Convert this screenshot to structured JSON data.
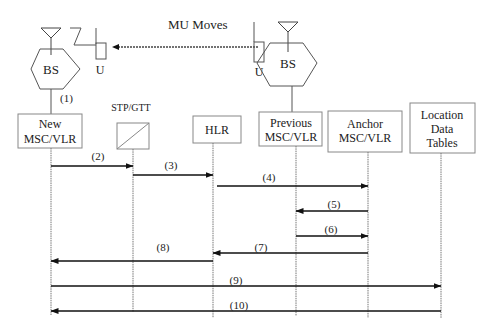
{
  "title_label": "MU Moves",
  "base_stations": [
    {
      "id": "bs-new",
      "label": "BS",
      "unit_label": "U"
    },
    {
      "id": "bs-previous",
      "label": "BS",
      "unit_label": "U"
    }
  ],
  "link_label": "(1)",
  "entities": [
    {
      "id": "new-msc-vlr",
      "lines": [
        "New",
        "MSC/VLR"
      ]
    },
    {
      "id": "stp-gtt",
      "lines": [],
      "top_label": "STP/GTT"
    },
    {
      "id": "hlr",
      "lines": [
        "HLR"
      ]
    },
    {
      "id": "previous-msc-vlr",
      "lines": [
        "Previous",
        "MSC/VLR"
      ]
    },
    {
      "id": "anchor-msc-vlr",
      "lines": [
        "Anchor",
        "MSC/VLR"
      ]
    },
    {
      "id": "location-data-tables",
      "lines": [
        "Location",
        "Data",
        "Tables"
      ]
    }
  ],
  "messages": [
    {
      "label": "(2)",
      "from": "new-msc-vlr",
      "to": "stp-gtt"
    },
    {
      "label": "(3)",
      "from": "stp-gtt",
      "to": "hlr"
    },
    {
      "label": "(4)",
      "from": "hlr",
      "to": "anchor-msc-vlr"
    },
    {
      "label": "(5)",
      "from": "anchor-msc-vlr",
      "to": "previous-msc-vlr"
    },
    {
      "label": "(6)",
      "from": "previous-msc-vlr",
      "to": "anchor-msc-vlr"
    },
    {
      "label": "(7)",
      "from": "anchor-msc-vlr",
      "to": "hlr"
    },
    {
      "label": "(8)",
      "from": "hlr",
      "to": "new-msc-vlr"
    },
    {
      "label": "(9)",
      "from": "new-msc-vlr",
      "to": "location-data-tables"
    },
    {
      "label": "(10)",
      "from": "location-data-tables",
      "to": "new-msc-vlr"
    }
  ]
}
